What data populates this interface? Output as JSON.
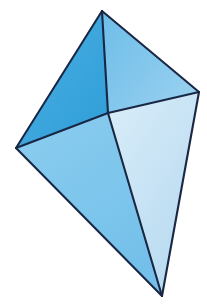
{
  "figure": {
    "name": "triangular-bipyramid",
    "background_color": "#ffffff",
    "canvas": {
      "width": 207,
      "height": 304
    },
    "edge_color": "#1a2744",
    "edge_width": 2.1,
    "vertices": {
      "top_apex": {
        "label": "top apex",
        "x": 102,
        "y": 11
      },
      "left": {
        "label": "left vertex",
        "x": 16,
        "y": 148
      },
      "right": {
        "label": "right vertex",
        "x": 199,
        "y": 92
      },
      "bottom_apex": {
        "label": "bottom apex",
        "x": 162,
        "y": 296
      },
      "center_front": {
        "label": "front vertex",
        "x": 108,
        "y": 113
      }
    },
    "faces": [
      {
        "name": "upper-left-face",
        "points": "102,11 16,148 108,113",
        "fill_start": "#4aaee2",
        "fill_end": "#2f9ed8",
        "gradient_angle": 135
      },
      {
        "name": "upper-right-face",
        "points": "102,11 199,92 108,113",
        "fill_start": "#6dbde8",
        "fill_end": "#98d0f0",
        "gradient_angle": 150
      },
      {
        "name": "lower-left-face",
        "points": "16,148 108,113 162,296",
        "fill_start": "#8bcdef",
        "fill_end": "#74c0ea",
        "gradient_angle": 110
      },
      {
        "name": "lower-right-face",
        "points": "108,113 199,92 162,296",
        "fill_start": "#d8ecf8",
        "fill_end": "#b5d9f0",
        "gradient_angle": 100
      }
    ],
    "edges": [
      {
        "name": "edge-top-to-left",
        "x1": 102,
        "y1": 11,
        "x2": 16,
        "y2": 148
      },
      {
        "name": "edge-top-to-right",
        "x1": 102,
        "y1": 11,
        "x2": 199,
        "y2": 92
      },
      {
        "name": "edge-top-to-center",
        "x1": 102,
        "y1": 11,
        "x2": 108,
        "y2": 113
      },
      {
        "name": "edge-left-to-center",
        "x1": 16,
        "y1": 148,
        "x2": 108,
        "y2": 113
      },
      {
        "name": "edge-center-to-right",
        "x1": 108,
        "y1": 113,
        "x2": 199,
        "y2": 92
      },
      {
        "name": "edge-left-to-bottom",
        "x1": 16,
        "y1": 148,
        "x2": 162,
        "y2": 296
      },
      {
        "name": "edge-center-to-bottom",
        "x1": 108,
        "y1": 113,
        "x2": 162,
        "y2": 296
      },
      {
        "name": "edge-right-to-bottom",
        "x1": 199,
        "y1": 92,
        "x2": 162,
        "y2": 296
      }
    ]
  }
}
